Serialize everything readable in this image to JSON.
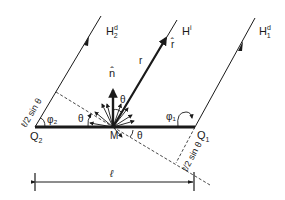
{
  "diagram": {
    "type": "geometry-scattering-diagram",
    "points": {
      "Q2": {
        "label": "Q",
        "sub": "2"
      },
      "M": {
        "label": "M"
      },
      "Q1": {
        "label": "Q",
        "sub": "1"
      }
    },
    "rays": {
      "H2d": {
        "label": "H",
        "sup": "d",
        "sub": "2"
      },
      "Hi": {
        "label": "H",
        "sup": "i"
      },
      "H1d": {
        "label": "H",
        "sup": "d",
        "sub": "1"
      }
    },
    "vectors": {
      "n_hat": "n̂",
      "r_hat": "r̂",
      "r": "r"
    },
    "angles": {
      "theta_top": "θ",
      "theta_left": "θ",
      "theta_right": "θ",
      "phi1": "φ₁",
      "phi2": "φ₂"
    },
    "dimensions": {
      "left_offset": "ℓ/2 sin θ",
      "right_offset": "ℓ/2 sin θ",
      "length": "ℓ"
    },
    "colors": {
      "ink": "#1a1a1a",
      "background": "#ffffff"
    }
  }
}
